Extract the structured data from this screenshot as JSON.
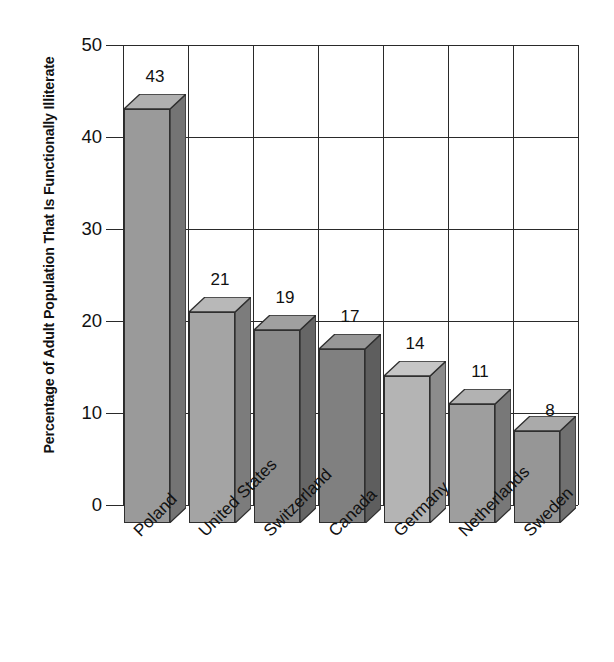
{
  "chart_data": {
    "type": "bar",
    "title": "",
    "subtitle": "",
    "xlabel": "",
    "ylabel": "Percentage of Adult Population That Is Functionally Illiterate",
    "categories": [
      "Poland",
      "United States",
      "Switzerland",
      "Canada",
      "Germany",
      "Netherlands",
      "Sweden"
    ],
    "values": [
      43,
      21,
      19,
      17,
      14,
      11,
      8
    ],
    "value_labels": [
      "43",
      "21",
      "19",
      "17",
      "14",
      "11",
      "8"
    ],
    "ylim": [
      0,
      50
    ],
    "ytick_labels": [
      "0",
      "10",
      "20",
      "30",
      "40",
      "50"
    ],
    "ytick_values": [
      0,
      10,
      20,
      30,
      40,
      50
    ],
    "grid": "both",
    "legend": "none",
    "style": "3d-bars-grayscale",
    "bar_colors_front": [
      "#9a9a9a",
      "#a4a4a4",
      "#8a8a8a",
      "#808080",
      "#b4b4b4",
      "#9e9e9e",
      "#969696"
    ],
    "bar_colors_top": [
      "#b0b0b0",
      "#b8b8b8",
      "#a0a0a0",
      "#979797",
      "#c6c6c6",
      "#b2b2b2",
      "#aaaaaa"
    ],
    "bar_colors_side": [
      "#747474",
      "#7c7c7c",
      "#666666",
      "#5e5e5e",
      "#8c8c8c",
      "#787878",
      "#707070"
    ],
    "axis_color": "#2a2a2a",
    "text_color": "#111111",
    "background": "#ffffff"
  }
}
